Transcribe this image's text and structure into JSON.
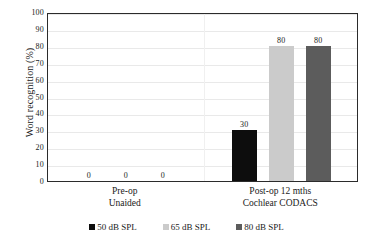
{
  "chart_data": {
    "type": "bar",
    "title": "",
    "xlabel": "",
    "ylabel": "Word recognition (%)",
    "ylim": [
      0,
      100
    ],
    "ytick_step": 10,
    "yticks": [
      100,
      90,
      80,
      70,
      60,
      50,
      40,
      30,
      20,
      10,
      0
    ],
    "grid": "horizontal",
    "legend_position": "bottom",
    "categories": [
      "Pre-op\nUnaided",
      "Post-op 12 mths\nCochlear CODACS"
    ],
    "category_lines": [
      [
        "Pre-op",
        "Unaided"
      ],
      [
        "Post-op 12 mths",
        "Cochlear CODACS"
      ]
    ],
    "series": [
      {
        "name": "50 dB SPL",
        "color": "#0d0d0d",
        "values": [
          0,
          30
        ]
      },
      {
        "name": "65 dB SPL",
        "color": "#cbcbcb",
        "values": [
          0,
          80
        ]
      },
      {
        "name": "80 dB SPL",
        "color": "#5c5c5c",
        "values": [
          0,
          80
        ]
      }
    ],
    "data_labels": [
      {
        "group": 0,
        "series": 0,
        "text": "0"
      },
      {
        "group": 0,
        "series": 1,
        "text": "0"
      },
      {
        "group": 0,
        "series": 2,
        "text": "0"
      },
      {
        "group": 1,
        "series": 0,
        "text": "30"
      },
      {
        "group": 1,
        "series": 1,
        "text": "80"
      },
      {
        "group": 1,
        "series": 2,
        "text": "80"
      }
    ]
  },
  "axis": {
    "y_title": "Word recognition (%)",
    "y_tick_labels": [
      "100",
      "90",
      "80",
      "70",
      "60",
      "50",
      "40",
      "30",
      "20",
      "10",
      "0"
    ]
  },
  "x_categories": [
    {
      "line1": "Pre-op",
      "line2": "Unaided"
    },
    {
      "line1": "Post-op 12 mths",
      "line2": "Cochlear CODACS"
    }
  ],
  "legend": {
    "items": [
      {
        "label": "50 dB SPL",
        "color": "#0d0d0d"
      },
      {
        "label": "65 dB SPL",
        "color": "#cbcbcb"
      },
      {
        "label": "80 dB SPL",
        "color": "#5c5c5c"
      }
    ]
  },
  "value_labels": {
    "g0s0": "0",
    "g0s1": "0",
    "g0s2": "0",
    "g1s0": "30",
    "g1s1": "80",
    "g1s2": "80"
  },
  "colors": {
    "axis": "#2b2b2b",
    "grid": "#e9e9e9",
    "text": "#1a1a1a",
    "plot_background": "#ffffff"
  }
}
